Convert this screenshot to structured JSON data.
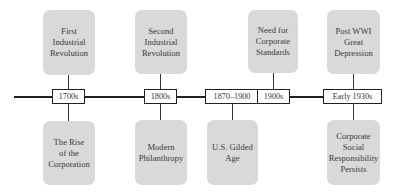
{
  "timeline": {
    "dates": [
      {
        "label": "1700s"
      },
      {
        "label": "1800s"
      },
      {
        "label": "1870–1900"
      },
      {
        "label": "1900s"
      },
      {
        "label": "Early 1930s"
      }
    ],
    "top_events": [
      {
        "label": "First Industrial Revolution",
        "lines": [
          "First",
          "Industrial",
          "Revolution"
        ]
      },
      {
        "label": "Second Industrial Revolution",
        "lines": [
          "Second",
          "Industrial",
          "Revolution"
        ]
      },
      {
        "label": "Need for Corporate Standards",
        "lines": [
          "Need for",
          "Corporate",
          "Standards"
        ]
      },
      {
        "label": "Post WWI Great Depression",
        "lines": [
          "Post WWI",
          "Great",
          "Depression"
        ]
      }
    ],
    "bottom_events": [
      {
        "label": "The Rise of the Corporation",
        "lines": [
          "The Rise",
          "of the",
          "Corporation"
        ]
      },
      {
        "label": "Modern Philanthropy",
        "lines": [
          "Modern",
          "Philanthropy"
        ]
      },
      {
        "label": "U.S. Gilded Age",
        "lines": [
          "U.S. Gilded",
          "Age"
        ]
      },
      {
        "label": "Corporate Social Responsibility Persists",
        "lines": [
          "Corporate",
          "Social",
          "Responsibility",
          "Persists"
        ]
      }
    ]
  },
  "colors": {
    "event_fill": "#d9d9d9",
    "line": "#222222",
    "date_fill": "#ffffff"
  }
}
